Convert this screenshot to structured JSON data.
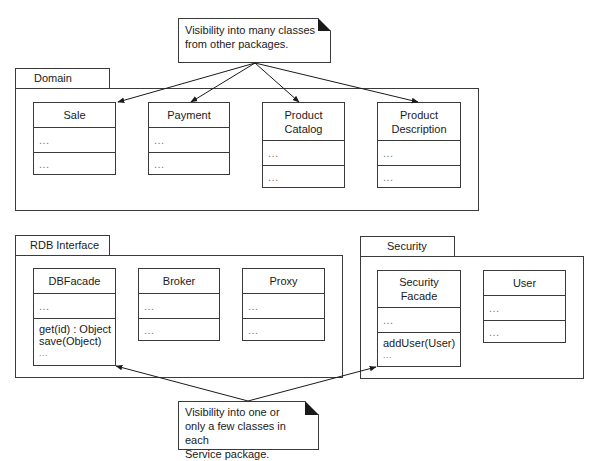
{
  "notes": {
    "top": {
      "lines": [
        "Visibility into many classes",
        "from other packages."
      ]
    },
    "bottom": {
      "lines": [
        "Visibility into one or",
        "only a few classes in each",
        "Service package."
      ]
    }
  },
  "packages": {
    "domain": {
      "name": "Domain",
      "classes": [
        {
          "name_lines": [
            "Sale"
          ],
          "attributes": [
            "..."
          ],
          "operations": [
            "..."
          ]
        },
        {
          "name_lines": [
            "Payment"
          ],
          "attributes": [
            "..."
          ],
          "operations": [
            "..."
          ]
        },
        {
          "name_lines": [
            "Product",
            "Catalog"
          ],
          "attributes": [
            "..."
          ],
          "operations": [
            "..."
          ]
        },
        {
          "name_lines": [
            "Product",
            "Description"
          ],
          "attributes": [
            "..."
          ],
          "operations": [
            "..."
          ]
        }
      ]
    },
    "rdb_interface": {
      "name": "RDB Interface",
      "classes": [
        {
          "name_lines": [
            "DBFacade"
          ],
          "attributes": [
            "..."
          ],
          "operations": [
            "get(id) : Object",
            "save(Object)",
            "..."
          ]
        },
        {
          "name_lines": [
            "Broker"
          ],
          "attributes": [
            "..."
          ],
          "operations": [
            "..."
          ]
        },
        {
          "name_lines": [
            "Proxy"
          ],
          "attributes": [
            "..."
          ],
          "operations": [
            "..."
          ]
        }
      ]
    },
    "security": {
      "name": "Security",
      "classes": [
        {
          "name_lines": [
            "Security",
            "Facade"
          ],
          "attributes": [
            "..."
          ],
          "operations": [
            "addUser(User)",
            "..."
          ]
        },
        {
          "name_lines": [
            "User"
          ],
          "attributes": [
            "..."
          ],
          "operations": [
            "..."
          ]
        }
      ]
    }
  },
  "colors": {
    "line": "#3a3a3a",
    "text": "#1a1a1a",
    "ellipsis": "#777777",
    "background": "#ffffff"
  }
}
